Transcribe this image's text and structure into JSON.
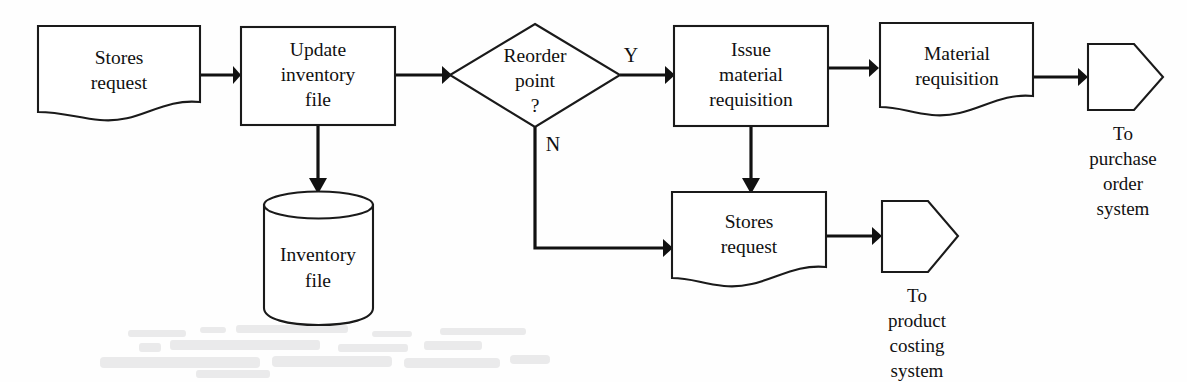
{
  "diagram": {
    "type": "flowchart",
    "stroke_color": "#111111",
    "fill_color": "#ffffff",
    "nodes": [
      {
        "id": "stores_request_in",
        "shape": "document",
        "lines": [
          "Stores",
          "request"
        ]
      },
      {
        "id": "update_inventory",
        "shape": "process",
        "lines": [
          "Update",
          "inventory",
          "file"
        ]
      },
      {
        "id": "inventory_file",
        "shape": "database-cylinder",
        "lines": [
          "Inventory",
          "file"
        ]
      },
      {
        "id": "reorder_point",
        "shape": "decision",
        "lines": [
          "Reorder",
          "point",
          "?"
        ]
      },
      {
        "id": "issue_material_requisition",
        "shape": "process",
        "lines": [
          "Issue",
          "material",
          "requisition"
        ]
      },
      {
        "id": "material_requisition_doc",
        "shape": "document",
        "lines": [
          "Material",
          "requisition"
        ]
      },
      {
        "id": "to_purchase_order",
        "shape": "offpage-connector",
        "caption": [
          "To",
          "purchase",
          "order",
          "system"
        ]
      },
      {
        "id": "stores_request_out",
        "shape": "document",
        "lines": [
          "Stores",
          "request"
        ]
      },
      {
        "id": "to_product_costing",
        "shape": "offpage-connector",
        "caption": [
          "To",
          "product",
          "costing",
          "system"
        ]
      }
    ],
    "edges": [
      {
        "id": "e1",
        "from": "stores_request_in",
        "to": "update_inventory",
        "label": ""
      },
      {
        "id": "e2",
        "from": "update_inventory",
        "to": "inventory_file",
        "label": ""
      },
      {
        "id": "e3",
        "from": "update_inventory",
        "to": "reorder_point",
        "label": ""
      },
      {
        "id": "e4",
        "from": "reorder_point",
        "to": "issue_material_requisition",
        "label": "Y"
      },
      {
        "id": "e5",
        "from": "reorder_point",
        "to": "stores_request_out",
        "label": "N"
      },
      {
        "id": "e6",
        "from": "issue_material_requisition",
        "to": "material_requisition_doc",
        "label": ""
      },
      {
        "id": "e7",
        "from": "issue_material_requisition",
        "to": "stores_request_out",
        "label": ""
      },
      {
        "id": "e8",
        "from": "material_requisition_doc",
        "to": "to_purchase_order",
        "label": ""
      },
      {
        "id": "e9",
        "from": "stores_request_out",
        "to": "to_product_costing",
        "label": ""
      }
    ]
  },
  "labels": {
    "stores_request_in_l1": "Stores",
    "stores_request_in_l2": "request",
    "update_inventory_l1": "Update",
    "update_inventory_l2": "inventory",
    "update_inventory_l3": "file",
    "inventory_file_l1": "Inventory",
    "inventory_file_l2": "file",
    "reorder_point_l1": "Reorder",
    "reorder_point_l2": "point",
    "reorder_point_l3": "?",
    "issue_mr_l1": "Issue",
    "issue_mr_l2": "material",
    "issue_mr_l3": "requisition",
    "material_req_l1": "Material",
    "material_req_l2": "requisition",
    "stores_request_out_l1": "Stores",
    "stores_request_out_l2": "request",
    "branch_yes": "Y",
    "branch_no": "N",
    "purchase_cap_l1": "To",
    "purchase_cap_l2": "purchase",
    "purchase_cap_l3": "order",
    "purchase_cap_l4": "system",
    "costing_cap_l1": "To",
    "costing_cap_l2": "product",
    "costing_cap_l3": "costing",
    "costing_cap_l4": "system"
  }
}
